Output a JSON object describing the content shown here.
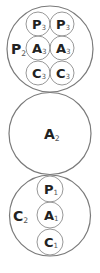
{
  "diagram": {
    "type": "nested-circles",
    "groups": [
      {
        "id": "top",
        "label": {
          "main": "P",
          "sub": "2"
        },
        "outer": {
          "cx": 50,
          "cy": 49,
          "r": 43
        },
        "label_pos": {
          "x": 11,
          "y": 54
        },
        "children": [
          {
            "main": "P",
            "sub": "3",
            "cx": 38,
            "cy": 24,
            "r": 12
          },
          {
            "main": "P",
            "sub": "3",
            "cx": 62,
            "cy": 24,
            "r": 12
          },
          {
            "main": "A",
            "sub": "3",
            "cx": 38,
            "cy": 48,
            "r": 12
          },
          {
            "main": "A",
            "sub": "3",
            "cx": 62,
            "cy": 48,
            "r": 12
          },
          {
            "main": "C",
            "sub": "3",
            "cx": 38,
            "cy": 73,
            "r": 12
          },
          {
            "main": "C",
            "sub": "3",
            "cx": 62,
            "cy": 73,
            "r": 12
          }
        ]
      },
      {
        "id": "middle",
        "label": {
          "main": "A",
          "sub": "2"
        },
        "outer": {
          "cx": 50,
          "cy": 133.5,
          "r": 41
        },
        "label_pos": {
          "x": 44,
          "y": 139
        },
        "children": []
      },
      {
        "id": "bottom",
        "label": {
          "main": "C",
          "sub": "2"
        },
        "outer": {
          "cx": 50,
          "cy": 215.5,
          "r": 40.5
        },
        "label_pos": {
          "x": 13,
          "y": 221
        },
        "children": [
          {
            "main": "P",
            "sub": "1",
            "cx": 50,
            "cy": 189,
            "r": 13
          },
          {
            "main": "A",
            "sub": "1",
            "cx": 50,
            "cy": 215,
            "r": 13
          },
          {
            "main": "C",
            "sub": "1",
            "cx": 50,
            "cy": 242,
            "r": 13
          }
        ]
      }
    ]
  }
}
